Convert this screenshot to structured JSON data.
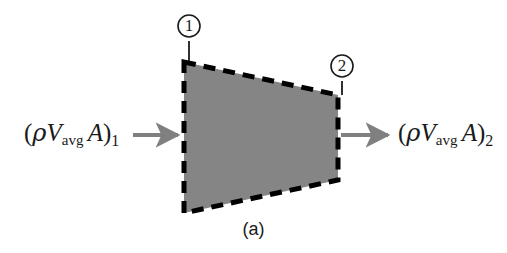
{
  "figure": {
    "caption": "(a)",
    "background_color": "#ffffff",
    "body_fill_color": "#858585",
    "outline_color": "#000000",
    "arrow_color": "#808080",
    "text_color": "#1a1a1a"
  },
  "control_volume": {
    "name": "control-volume-trapezoid",
    "shape": "trapezoid",
    "description": "Shaded control volume with dashed boundary, wider at inlet than outlet",
    "vertices": [
      {
        "x": 184,
        "y": 62
      },
      {
        "x": 338,
        "y": 95
      },
      {
        "x": 338,
        "y": 180
      },
      {
        "x": 184,
        "y": 213
      }
    ],
    "border_style": "dashed",
    "border_width_px": 5
  },
  "stations": [
    {
      "id": "1",
      "number": "①",
      "label": "1",
      "position": "inlet",
      "circle": {
        "cx": 189,
        "cy": 26,
        "r": 11
      },
      "leader": {
        "x": 189,
        "y1": 41,
        "y2": 61
      }
    },
    {
      "id": "2",
      "number": "②",
      "label": "2",
      "position": "outlet",
      "circle": {
        "cx": 342,
        "cy": 66,
        "r": 11
      },
      "leader": {
        "x": 342,
        "y1": 81,
        "y2": 95
      }
    }
  ],
  "flows": [
    {
      "name": "inlet-mass-flow",
      "direction": "right",
      "label": {
        "open_paren": "(",
        "rho": "ρ",
        "velocity": "V",
        "velocity_subscript": "avg",
        "area": "A",
        "close_paren": ")",
        "station_subscript": "1",
        "plain_text": "(ρV_avg A)₁"
      },
      "arrow": {
        "x1": 133,
        "y1": 135,
        "x2": 182,
        "y2": 135
      }
    },
    {
      "name": "outlet-mass-flow",
      "direction": "right",
      "label": {
        "open_paren": "(",
        "rho": "ρ",
        "velocity": "V",
        "velocity_subscript": "avg",
        "area": "A",
        "close_paren": ")",
        "station_subscript": "2",
        "plain_text": "(ρV_avg A)₂"
      },
      "arrow": {
        "x1": 340,
        "y1": 135,
        "x2": 392,
        "y2": 135
      }
    }
  ]
}
